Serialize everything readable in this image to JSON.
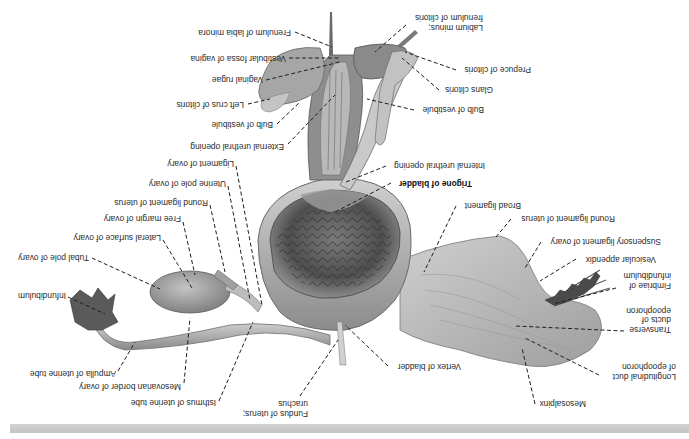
{
  "figure": {
    "orientation_degrees": 180,
    "colors": {
      "background": "#ffffff",
      "ink": "#2a2a2a",
      "tissue_light": "#dcdcdc",
      "tissue_mid": "#a9a9a9",
      "tissue_dark": "#555555",
      "footer_bar": "#c8c8c8"
    }
  },
  "labels": [
    {
      "id": "frenulum-labia-minora",
      "text": "Frenulum of labia minora",
      "x": 193,
      "y": 27,
      "w": 98,
      "h": 10,
      "bold": false
    },
    {
      "id": "vestibular-fossa",
      "text": "Vestibular fossa of vagina",
      "x": 180,
      "y": 53,
      "w": 106,
      "h": 10,
      "bold": false
    },
    {
      "id": "vaginal-rugae",
      "text": "Vaginal rugae",
      "x": 207,
      "y": 74,
      "w": 56,
      "h": 10,
      "bold": false
    },
    {
      "id": "left-crus-clitoris",
      "text": "Left crus of clitoris",
      "x": 168,
      "y": 99,
      "w": 76,
      "h": 10,
      "bold": false
    },
    {
      "id": "bulb-vestibule-left",
      "text": "Bulb of vestibule",
      "x": 206,
      "y": 119,
      "w": 67,
      "h": 10,
      "bold": false
    },
    {
      "id": "external-urethral-opening",
      "text": "External urethral opening",
      "x": 184,
      "y": 141,
      "w": 100,
      "h": 10,
      "bold": false
    },
    {
      "id": "ligament-ovary",
      "text": "Ligament of ovary",
      "x": 159,
      "y": 158,
      "w": 75,
      "h": 10,
      "bold": false
    },
    {
      "id": "uterine-pole-ovary",
      "text": "Uterine pole of ovary",
      "x": 139,
      "y": 178,
      "w": 87,
      "h": 10,
      "bold": false
    },
    {
      "id": "round-ligament-left",
      "text": "Round ligament of uterus",
      "x": 107,
      "y": 197,
      "w": 101,
      "h": 10,
      "bold": false
    },
    {
      "id": "free-margin-ovary",
      "text": "Free margin of ovary",
      "x": 99,
      "y": 213,
      "w": 82,
      "h": 10,
      "bold": false
    },
    {
      "id": "lateral-surface-ovary",
      "text": "Lateral surface of ovary",
      "x": 64,
      "y": 232,
      "w": 97,
      "h": 10,
      "bold": false
    },
    {
      "id": "tubal-pole-ovary",
      "text": "Tubal pole of ovary",
      "x": 14,
      "y": 252,
      "w": 75,
      "h": 10,
      "bold": false
    },
    {
      "id": "infundibulum-left",
      "text": "Infundibulum",
      "x": 14,
      "y": 290,
      "w": 52,
      "h": 10,
      "bold": false
    },
    {
      "id": "ampulla-uterine-tube",
      "text": "Ampulla of uterine tube",
      "x": 17,
      "y": 368,
      "w": 99,
      "h": 10,
      "bold": false
    },
    {
      "id": "mesovarian-border",
      "text": "Mesovarian border of ovary",
      "x": 71,
      "y": 381,
      "w": 110,
      "h": 10,
      "bold": false
    },
    {
      "id": "isthmus-uterine-tube",
      "text": "Isthmus of uterine tube",
      "x": 117,
      "y": 397,
      "w": 99,
      "h": 10,
      "bold": false
    },
    {
      "id": "fundus-uterus-urachus",
      "text": "Fundus of uterus;\nurachus",
      "x": 261,
      "y": 398,
      "w": 47,
      "h": 20,
      "bold": false
    },
    {
      "id": "labium-minus-frenulum-clitoris",
      "text": "Labium minus;\nfrenulum of clitoris",
      "x": 409,
      "y": 12,
      "w": 74,
      "h": 20,
      "bold": false
    },
    {
      "id": "prepuce-clitoris",
      "text": "Prepuce of clitoris",
      "x": 459,
      "y": 64,
      "w": 72,
      "h": 10,
      "bold": false
    },
    {
      "id": "glans-clitoris",
      "text": "Glans clitoris",
      "x": 441,
      "y": 84,
      "w": 52,
      "h": 10,
      "bold": false
    },
    {
      "id": "bulb-vestibule-right",
      "text": "Bulb of vestibule",
      "x": 417,
      "y": 104,
      "w": 67,
      "h": 10,
      "bold": false
    },
    {
      "id": "internal-urethral-opening",
      "text": "Internal urethral opening",
      "x": 388,
      "y": 160,
      "w": 97,
      "h": 10,
      "bold": false
    },
    {
      "id": "trigone-bladder",
      "text": "Trigone of bladder",
      "x": 394,
      "y": 178,
      "w": 78,
      "h": 10,
      "bold": true
    },
    {
      "id": "broad-ligament",
      "text": "Broad ligament",
      "x": 459,
      "y": 200,
      "w": 62,
      "h": 10,
      "bold": false
    },
    {
      "id": "round-ligament-right",
      "text": "Round ligament of uterus",
      "x": 514,
      "y": 213,
      "w": 101,
      "h": 10,
      "bold": false
    },
    {
      "id": "suspensory-ligament-ovary",
      "text": "Suspensory ligament of ovary",
      "x": 544,
      "y": 236,
      "w": 117,
      "h": 10,
      "bold": false
    },
    {
      "id": "vesicular-appendix",
      "text": "Vesicular appendix",
      "x": 579,
      "y": 254,
      "w": 77,
      "h": 10,
      "bold": false
    },
    {
      "id": "fimbriae-infundibulum",
      "text": "Fimbriae of\ninfundibulum",
      "x": 619,
      "y": 270,
      "w": 52,
      "h": 20,
      "bold": false
    },
    {
      "id": "transverse-ducts-epoophoron",
      "text": "Transverse\nducts of\nepoophoron",
      "x": 627,
      "y": 305,
      "w": 44,
      "h": 29,
      "bold": false
    },
    {
      "id": "vertex-bladder",
      "text": "Vertex of bladder",
      "x": 391,
      "y": 361,
      "w": 70,
      "h": 10,
      "bold": false
    },
    {
      "id": "longitudinal-duct-epoophoron",
      "text": "Longitudinal duct\nof epoophoron",
      "x": 602,
      "y": 361,
      "w": 74,
      "h": 20,
      "bold": false
    },
    {
      "id": "mesosalpinx",
      "text": "Mesosalpinx",
      "x": 531,
      "y": 398,
      "w": 55,
      "h": 10,
      "bold": false
    }
  ],
  "leaders": [
    {
      "for": "frenulum-labia-minora",
      "x1": 295,
      "y1": 32,
      "x2": 332,
      "y2": 47
    },
    {
      "for": "vestibular-fossa",
      "x1": 289,
      "y1": 58,
      "x2": 340,
      "y2": 58
    },
    {
      "for": "vaginal-rugae",
      "x1": 266,
      "y1": 80,
      "x2": 340,
      "y2": 62
    },
    {
      "for": "left-crus-clitoris",
      "x1": 248,
      "y1": 104,
      "x2": 270,
      "y2": 99
    },
    {
      "for": "bulb-vestibule-left",
      "x1": 277,
      "y1": 124,
      "x2": 300,
      "y2": 102
    },
    {
      "for": "external-urethral-opening",
      "x1": 288,
      "y1": 144,
      "x2": 335,
      "y2": 95
    },
    {
      "for": "ligament-ovary",
      "x1": 236,
      "y1": 166,
      "x2": 262,
      "y2": 305
    },
    {
      "for": "uterine-pole-ovary",
      "x1": 228,
      "y1": 186,
      "x2": 250,
      "y2": 300
    },
    {
      "for": "round-ligament-left",
      "x1": 210,
      "y1": 205,
      "x2": 225,
      "y2": 272
    },
    {
      "for": "free-margin-ovary",
      "x1": 183,
      "y1": 222,
      "x2": 195,
      "y2": 275
    },
    {
      "for": "lateral-surface-ovary",
      "x1": 163,
      "y1": 240,
      "x2": 192,
      "y2": 288
    },
    {
      "for": "tubal-pole-ovary",
      "x1": 92,
      "y1": 258,
      "x2": 160,
      "y2": 289
    },
    {
      "for": "infundibulum-left",
      "x1": 68,
      "y1": 297,
      "x2": 105,
      "y2": 314
    },
    {
      "for": "ampulla-uterine-tube",
      "x1": 118,
      "y1": 371,
      "x2": 135,
      "y2": 342
    },
    {
      "for": "mesovarian-border",
      "x1": 184,
      "y1": 383,
      "x2": 190,
      "y2": 318
    },
    {
      "for": "isthmus-uterine-tube",
      "x1": 219,
      "y1": 401,
      "x2": 253,
      "y2": 322
    },
    {
      "for": "fundus-uterus-urachus",
      "x1": 300,
      "y1": 396,
      "x2": 338,
      "y2": 340
    },
    {
      "for": "labium-minus-frenulum-clitoris",
      "x1": 406,
      "y1": 25,
      "x2": 375,
      "y2": 52
    },
    {
      "for": "prepuce-clitoris",
      "x1": 456,
      "y1": 70,
      "x2": 405,
      "y2": 52
    },
    {
      "for": "glans-clitoris",
      "x1": 439,
      "y1": 90,
      "x2": 402,
      "y2": 58
    },
    {
      "for": "bulb-vestibule-right",
      "x1": 414,
      "y1": 110,
      "x2": 367,
      "y2": 99
    },
    {
      "for": "internal-urethral-opening",
      "x1": 386,
      "y1": 166,
      "x2": 346,
      "y2": 182
    },
    {
      "for": "trigone-bladder",
      "x1": 391,
      "y1": 183,
      "x2": 335,
      "y2": 212
    },
    {
      "for": "broad-ligament",
      "x1": 456,
      "y1": 206,
      "x2": 424,
      "y2": 272
    },
    {
      "for": "round-ligament-right",
      "x1": 511,
      "y1": 219,
      "x2": 496,
      "y2": 237
    },
    {
      "for": "suspensory-ligament-ovary",
      "x1": 541,
      "y1": 242,
      "x2": 525,
      "y2": 268
    },
    {
      "for": "vesicular-appendix",
      "x1": 576,
      "y1": 259,
      "x2": 540,
      "y2": 281
    },
    {
      "for": "fimbriae-infundibulum",
      "x1": 616,
      "y1": 288,
      "x2": 553,
      "y2": 304
    },
    {
      "for": "transverse-ducts-epoophoron",
      "x1": 624,
      "y1": 331,
      "x2": 515,
      "y2": 326
    },
    {
      "for": "vertex-bladder",
      "x1": 388,
      "y1": 366,
      "x2": 345,
      "y2": 325
    },
    {
      "for": "longitudinal-duct-epoophoron",
      "x1": 599,
      "y1": 375,
      "x2": 525,
      "y2": 338
    },
    {
      "for": "mesosalpinx",
      "x1": 535,
      "y1": 404,
      "x2": 522,
      "y2": 348
    }
  ]
}
